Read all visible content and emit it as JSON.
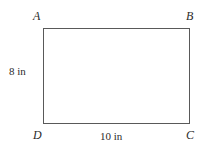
{
  "figure": {
    "type": "rectangle-diagram",
    "shape_name": "rectangle-ABCD",
    "stroke_color": "#595959",
    "background_color": "#ffffff",
    "text_color": "#2b2b2b"
  },
  "vertices": [
    {
      "key": "A",
      "label": "A",
      "position": "top-left"
    },
    {
      "key": "B",
      "label": "B",
      "position": "top-right"
    },
    {
      "key": "C",
      "label": "C",
      "position": "bottom-right"
    },
    {
      "key": "D",
      "label": "D",
      "position": "bottom-left"
    }
  ],
  "dimensions": {
    "left": "8 in",
    "bottom": "10 in"
  }
}
